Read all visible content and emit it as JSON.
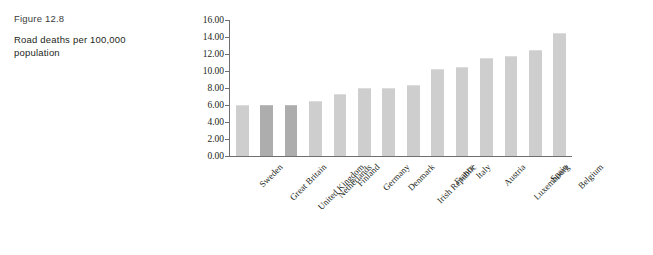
{
  "figure": {
    "label": "Figure 12.8",
    "title": "Road deaths per 100,000 population"
  },
  "colors": {
    "bar_default": "#cecece",
    "bar_highlight": "#adadad",
    "axis": "#6f6f6f",
    "text": "#231f20",
    "background": "#ffffff"
  },
  "chart_data": {
    "type": "bar",
    "title": "Road deaths per 100,000 population",
    "xlabel": "",
    "ylabel": "",
    "ylim": [
      0,
      16
    ],
    "ytick_step": 2,
    "grid": false,
    "legend": "none",
    "tick_label_format": "0.00",
    "yticks": [
      "0.00",
      "2.00",
      "4.00",
      "6.00",
      "8.00",
      "10.00",
      "12.00",
      "14.00",
      "16.00"
    ],
    "categories": [
      "Sweden",
      "Great Britain",
      "United Kingdom",
      "Netherlands",
      "Finland",
      "Germany",
      "Denmark",
      "Irish Republic",
      "France",
      "Italy",
      "Austria",
      "Luxembourg",
      "Spain",
      "Belgium"
    ],
    "values": [
      5.9,
      5.9,
      5.9,
      6.3,
      7.2,
      7.9,
      7.9,
      8.2,
      10.1,
      10.4,
      11.4,
      11.7,
      12.4,
      14.3
    ],
    "highlighted_categories": [
      "Great Britain",
      "United Kingdom"
    ]
  }
}
